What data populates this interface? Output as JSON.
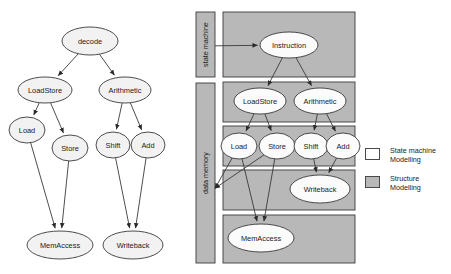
{
  "figure": {
    "colors": {
      "node_fill_light": "#f2f2f2",
      "node_fill_white": "#fbfbfb",
      "band_fill_gray": "#b8b8b8",
      "bar_fill_gray": "#b8b8b8",
      "stroke": "#3a3a3a",
      "text": "#1a1a1a"
    }
  },
  "left_diagram": {
    "name": "state-machine-tree",
    "nodes": [
      {
        "id": "decode",
        "label": "decode",
        "cx": 90,
        "cy": 41,
        "rx": 28,
        "ry": 14
      },
      {
        "id": "loadstore",
        "label": "LoadStore",
        "cx": 45,
        "cy": 90,
        "rx": 27,
        "ry": 13
      },
      {
        "id": "arithmetic",
        "label": "Arithmetic",
        "cx": 125,
        "cy": 90,
        "rx": 26,
        "ry": 13
      },
      {
        "id": "load",
        "label": "Load",
        "cx": 27,
        "cy": 130,
        "rx": 18,
        "ry": 13
      },
      {
        "id": "store",
        "label": "Store",
        "cx": 70,
        "cy": 148,
        "rx": 18,
        "ry": 13
      },
      {
        "id": "shift",
        "label": "Shift",
        "cx": 113,
        "cy": 145,
        "rx": 17,
        "ry": 13
      },
      {
        "id": "add",
        "label": "Add",
        "cx": 148,
        "cy": 145,
        "rx": 17,
        "ry": 13
      },
      {
        "id": "memaccess",
        "label": "MemAccess",
        "cx": 60,
        "cy": 245,
        "rx": 33,
        "ry": 14
      },
      {
        "id": "writeback",
        "label": "Writeback",
        "cx": 133,
        "cy": 245,
        "rx": 30,
        "ry": 14
      }
    ],
    "edges": [
      {
        "from": "decode",
        "to": "loadstore"
      },
      {
        "from": "decode",
        "to": "arithmetic"
      },
      {
        "from": "loadstore",
        "to": "load"
      },
      {
        "from": "loadstore",
        "to": "store"
      },
      {
        "from": "arithmetic",
        "to": "shift"
      },
      {
        "from": "arithmetic",
        "to": "add"
      },
      {
        "from": "load",
        "to": "memaccess"
      },
      {
        "from": "store",
        "to": "memaccess"
      },
      {
        "from": "shift",
        "to": "writeback"
      },
      {
        "from": "add",
        "to": "writeback"
      }
    ]
  },
  "right_diagram": {
    "name": "structure-modelling-tree",
    "side_bars": [
      {
        "id": "state-machine-bar",
        "label": "state machine",
        "x": 196,
        "y": 12,
        "w": 19,
        "h": 65
      },
      {
        "id": "data-memory-bar",
        "label": "data memory",
        "x": 196,
        "y": 83,
        "w": 19,
        "h": 180
      }
    ],
    "bands": [
      {
        "id": "band-instruction",
        "x": 223,
        "y": 12,
        "w": 132,
        "h": 65
      },
      {
        "id": "band-decoders",
        "x": 223,
        "y": 82,
        "w": 132,
        "h": 40
      },
      {
        "id": "band-ops",
        "x": 223,
        "y": 126,
        "w": 132,
        "h": 40
      },
      {
        "id": "band-writeback",
        "x": 223,
        "y": 170,
        "w": 132,
        "h": 40
      },
      {
        "id": "band-memaccess",
        "x": 223,
        "y": 215,
        "w": 132,
        "h": 48
      }
    ],
    "nodes": [
      {
        "id": "instruction",
        "label": "Instruction",
        "cx": 289,
        "cy": 45,
        "rx": 29,
        "ry": 13
      },
      {
        "id": "loadstore",
        "label": "LoadStore",
        "cx": 260,
        "cy": 101,
        "rx": 26,
        "ry": 13
      },
      {
        "id": "arithmetic",
        "label": "Arithmetic",
        "cx": 320,
        "cy": 101,
        "rx": 26,
        "ry": 13
      },
      {
        "id": "load",
        "label": "Load",
        "cx": 239,
        "cy": 146,
        "rx": 18,
        "ry": 13
      },
      {
        "id": "store",
        "label": "Store",
        "cx": 277,
        "cy": 146,
        "rx": 18,
        "ry": 13
      },
      {
        "id": "shift",
        "label": "Shift",
        "cx": 311,
        "cy": 146,
        "rx": 17,
        "ry": 13
      },
      {
        "id": "add",
        "label": "Add",
        "cx": 343,
        "cy": 146,
        "rx": 17,
        "ry": 13
      },
      {
        "id": "writeback",
        "label": "Writeback",
        "cx": 320,
        "cy": 189,
        "rx": 30,
        "ry": 14
      },
      {
        "id": "memaccess",
        "label": "MemAccess",
        "cx": 261,
        "cy": 238,
        "rx": 33,
        "ry": 14
      }
    ],
    "edges": [
      {
        "from": "instruction",
        "to": "loadstore"
      },
      {
        "from": "instruction",
        "to": "arithmetic"
      },
      {
        "from": "loadstore",
        "to": "load"
      },
      {
        "from": "loadstore",
        "to": "store"
      },
      {
        "from": "arithmetic",
        "to": "shift"
      },
      {
        "from": "arithmetic",
        "to": "add"
      },
      {
        "from": "shift",
        "to": "writeback"
      },
      {
        "from": "add",
        "to": "writeback"
      },
      {
        "from": "load",
        "to": "memaccess"
      },
      {
        "from": "store",
        "to": "memaccess"
      }
    ],
    "cross_edges": [
      {
        "id": "state-machine-to-instruction",
        "from": "state-machine-bar",
        "to": "instruction"
      },
      {
        "id": "load-to-data-memory",
        "from": "load",
        "to": "data-memory-bar"
      },
      {
        "id": "store-to-data-memory",
        "from": "store",
        "to": "data-memory-bar"
      }
    ]
  },
  "legend": {
    "name": "legend",
    "items": [
      {
        "id": "state-machine-modelling",
        "label_line1": "State machine",
        "label_line2": "Modelling",
        "swatch": "#ffffff"
      },
      {
        "id": "structure-modelling",
        "label_line1": "Structure",
        "label_line2": "Modelling",
        "swatch": "#b8b8b8"
      }
    ]
  }
}
